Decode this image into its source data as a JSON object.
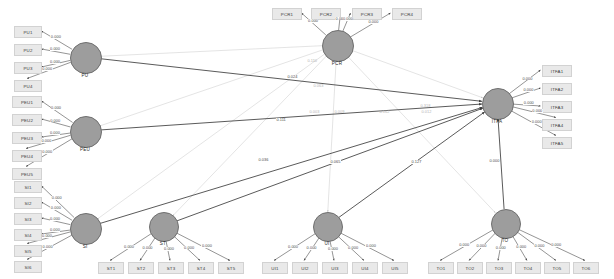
{
  "diagram": {
    "type": "sem-path-diagram",
    "title": "",
    "background": "#ffffff",
    "node_fill": "#9d9d9d",
    "node_stroke": "#6f6f6f",
    "indicator_fill": "#e9e9e9",
    "edge_color": "#3c3c3c",
    "faint_edge_color": "#c8c8c8"
  },
  "constructs": [
    {
      "id": "PU",
      "label": "PU",
      "cx": 85,
      "cy": 57,
      "r": 15,
      "indicators": [
        {
          "label": "PU1",
          "x": 14,
          "y": 26,
          "w": 26,
          "h": 10,
          "loading": "0.000"
        },
        {
          "label": "PU2",
          "x": 14,
          "y": 44,
          "w": 26,
          "h": 10,
          "loading": "0.000"
        },
        {
          "label": "PU3",
          "x": 14,
          "y": 62,
          "w": 26,
          "h": 10,
          "loading": "0.000"
        },
        {
          "label": "PU4",
          "x": 14,
          "y": 80,
          "w": 26,
          "h": 10,
          "loading": "0.000"
        }
      ]
    },
    {
      "id": "PEU",
      "label": "PEU",
      "cx": 85,
      "cy": 131,
      "r": 15,
      "indicators": [
        {
          "label": "PEU1",
          "x": 12,
          "y": 96,
          "w": 28,
          "h": 10,
          "loading": "0.000"
        },
        {
          "label": "PEU2",
          "x": 12,
          "y": 114,
          "w": 28,
          "h": 10,
          "loading": "0.000"
        },
        {
          "label": "PEU3",
          "x": 12,
          "y": 132,
          "w": 28,
          "h": 10,
          "loading": "0.000"
        },
        {
          "label": "PEU4",
          "x": 12,
          "y": 150,
          "w": 28,
          "h": 10,
          "loading": "0.000"
        },
        {
          "label": "PEU5",
          "x": 12,
          "y": 168,
          "w": 28,
          "h": 10,
          "loading": "0.000"
        }
      ]
    },
    {
      "id": "SI",
      "label": "SI",
      "cx": 85,
      "cy": 228,
      "r": 15,
      "indicators": [
        {
          "label": "SI1",
          "x": 14,
          "y": 181,
          "w": 26,
          "h": 10,
          "loading": "0.000"
        },
        {
          "label": "SI2",
          "x": 14,
          "y": 197,
          "w": 26,
          "h": 10,
          "loading": "0.000"
        },
        {
          "label": "SI3",
          "x": 14,
          "y": 213,
          "w": 26,
          "h": 10,
          "loading": "0.000"
        },
        {
          "label": "SI4",
          "x": 14,
          "y": 229,
          "w": 26,
          "h": 10,
          "loading": "0.000"
        },
        {
          "label": "SI5",
          "x": 14,
          "y": 245,
          "w": 26,
          "h": 10,
          "loading": "0.000"
        },
        {
          "label": "SI6",
          "x": 14,
          "y": 261,
          "w": 26,
          "h": 10,
          "loading": "0.000"
        }
      ]
    },
    {
      "id": "PCR",
      "label": "PCR",
      "cx": 337,
      "cy": 45,
      "r": 15,
      "indicators": [
        {
          "label": "PCR1",
          "x": 272,
          "y": 8,
          "w": 28,
          "h": 10,
          "loading": "0.000"
        },
        {
          "label": "PCR2",
          "x": 311,
          "y": 8,
          "w": 28,
          "h": 10,
          "loading": "0.000"
        },
        {
          "label": "PCR3",
          "x": 352,
          "y": 8,
          "w": 28,
          "h": 10,
          "loading": "0.000"
        },
        {
          "label": "PCR4",
          "x": 392,
          "y": 8,
          "w": 28,
          "h": 10,
          "loading": "0.000"
        }
      ]
    },
    {
      "id": "ITFA",
      "label": "ITFA",
      "cx": 497,
      "cy": 103,
      "r": 15,
      "indicators": [
        {
          "label": "ITFA1",
          "x": 542,
          "y": 65,
          "w": 28,
          "h": 10,
          "loading": "0.000"
        },
        {
          "label": "ITFA2",
          "x": 542,
          "y": 83,
          "w": 28,
          "h": 10,
          "loading": "0.000"
        },
        {
          "label": "ITFA3",
          "x": 542,
          "y": 101,
          "w": 28,
          "h": 10,
          "loading": "0.000"
        },
        {
          "label": "ITFA4",
          "x": 542,
          "y": 119,
          "w": 28,
          "h": 10,
          "loading": "0.000"
        },
        {
          "label": "ITFA5",
          "x": 542,
          "y": 137,
          "w": 28,
          "h": 10,
          "loading": "0.000"
        }
      ]
    },
    {
      "id": "ST",
      "label": "ST",
      "cx": 163,
      "cy": 226,
      "r": 14,
      "indicators": [
        {
          "label": "ST1",
          "x": 98,
          "y": 262,
          "w": 24,
          "h": 10,
          "loading": "0.000"
        },
        {
          "label": "ST2",
          "x": 128,
          "y": 262,
          "w": 24,
          "h": 10,
          "loading": "0.000"
        },
        {
          "label": "ST3",
          "x": 158,
          "y": 262,
          "w": 24,
          "h": 10,
          "loading": "0.000"
        },
        {
          "label": "ST4",
          "x": 188,
          "y": 262,
          "w": 24,
          "h": 10,
          "loading": "0.000"
        },
        {
          "label": "ST5",
          "x": 218,
          "y": 262,
          "w": 24,
          "h": 10,
          "loading": "0.000"
        }
      ]
    },
    {
      "id": "UI",
      "label": "UI",
      "cx": 327,
      "cy": 226,
      "r": 14,
      "indicators": [
        {
          "label": "UI1",
          "x": 262,
          "y": 262,
          "w": 24,
          "h": 10,
          "loading": "0.000"
        },
        {
          "label": "UI2",
          "x": 292,
          "y": 262,
          "w": 24,
          "h": 10,
          "loading": "0.000"
        },
        {
          "label": "UI3",
          "x": 322,
          "y": 262,
          "w": 24,
          "h": 10,
          "loading": "0.000"
        },
        {
          "label": "UI4",
          "x": 352,
          "y": 262,
          "w": 24,
          "h": 10,
          "loading": "0.000"
        },
        {
          "label": "UI5",
          "x": 382,
          "y": 262,
          "w": 24,
          "h": 10,
          "loading": "0.000"
        }
      ]
    },
    {
      "id": "TO",
      "label": "TO",
      "cx": 505,
      "cy": 223,
      "r": 14,
      "indicators": [
        {
          "label": "TO1",
          "x": 428,
          "y": 262,
          "w": 24,
          "h": 10,
          "loading": "0.000"
        },
        {
          "label": "TO2",
          "x": 457,
          "y": 262,
          "w": 24,
          "h": 10,
          "loading": "0.000"
        },
        {
          "label": "TO3",
          "x": 486,
          "y": 262,
          "w": 24,
          "h": 10,
          "loading": "0.000"
        },
        {
          "label": "TO4",
          "x": 515,
          "y": 262,
          "w": 24,
          "h": 10,
          "loading": "0.000"
        },
        {
          "label": "TO5",
          "x": 544,
          "y": 262,
          "w": 24,
          "h": 10,
          "loading": "0.000"
        },
        {
          "label": "TO6",
          "x": 573,
          "y": 262,
          "w": 24,
          "h": 10,
          "loading": "0.000"
        }
      ]
    }
  ],
  "structural_paths": [
    {
      "from": "PU",
      "to": "ITFA",
      "label": "0.024",
      "lx": 287,
      "ly": 75,
      "faint": false
    },
    {
      "from": "PEU",
      "to": "ITFA",
      "label": "0.111",
      "lx": 276,
      "ly": 118,
      "faint": false
    },
    {
      "from": "SI",
      "to": "ITFA",
      "label": "0.036",
      "lx": 258,
      "ly": 158,
      "faint": false
    },
    {
      "from": "ST",
      "to": "ITFA",
      "label": "0.065",
      "lx": 330,
      "ly": 160,
      "faint": false
    },
    {
      "from": "UI",
      "to": "ITFA",
      "label": "0.127",
      "lx": 411,
      "ly": 160,
      "faint": false
    },
    {
      "from": "TO",
      "to": "ITFA",
      "label": "0.000",
      "lx": 489,
      "ly": 159,
      "faint": false
    },
    {
      "from": "PCR",
      "to": "ITFA",
      "label": "0.318",
      "lx": 420,
      "ly": 104,
      "faint": true
    }
  ],
  "moderation_paths": [
    {
      "from": "PCR",
      "to": "PU",
      "label": "0.110",
      "lx": 307,
      "ly": 59,
      "faint": true
    },
    {
      "from": "PCR",
      "to": "PEU",
      "label": "0.063",
      "lx": 313,
      "ly": 84,
      "faint": true
    },
    {
      "from": "PCR",
      "to": "SI",
      "label": "0.003",
      "lx": 309,
      "ly": 110,
      "faint": true
    },
    {
      "from": "PCR",
      "to": "ST",
      "label": "0.009",
      "lx": 334,
      "ly": 110,
      "faint": true
    },
    {
      "from": "PCR",
      "to": "UI",
      "label": "0.162",
      "lx": 379,
      "ly": 110,
      "faint": true
    },
    {
      "from": "PCR",
      "to": "TO",
      "label": "0.012",
      "lx": 421,
      "ly": 110,
      "faint": true
    }
  ]
}
